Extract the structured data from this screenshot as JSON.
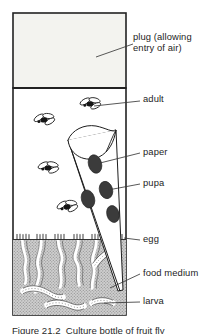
{
  "figure": {
    "caption": "Figure 21.2  Culture bottle of fruit fly",
    "colors": {
      "ink": "#1d1d1d",
      "outline": "#222222",
      "plug_fill": "#f2f2ee",
      "air_fill": "#ffffff",
      "medium_fill": "#c9c9c9",
      "medium_stipple": "#9a9a9a",
      "pupa_fill": "#3a3a3a",
      "fly_body": "#1a1a1a",
      "tunnel_fill": "#ffffff",
      "leader": "#3a3a3a"
    },
    "labels": [
      {
        "id": "plug",
        "name": "plug",
        "text": "plug (allowing\nentry of air)",
        "x": 133,
        "y": 37
      },
      {
        "id": "adult",
        "name": "adult",
        "text": "adult",
        "x": 143,
        "y": 98
      },
      {
        "id": "paper",
        "name": "paper",
        "text": "paper",
        "x": 143,
        "y": 150
      },
      {
        "id": "pupa",
        "name": "pupa",
        "text": "pupa",
        "x": 143,
        "y": 181
      },
      {
        "id": "egg",
        "name": "egg",
        "text": "egg",
        "x": 143,
        "y": 237
      },
      {
        "id": "food-medium",
        "name": "food medium",
        "text": "food medium",
        "x": 143,
        "y": 271
      },
      {
        "id": "larva",
        "name": "larva",
        "text": "larva",
        "x": 143,
        "y": 299
      }
    ],
    "leader_lines": [
      {
        "for": "plug",
        "x1": 96,
        "y1": 57,
        "x2": 131,
        "y2": 44
      },
      {
        "for": "adult",
        "x1": 94,
        "y1": 107,
        "x2": 140,
        "y2": 102
      },
      {
        "for": "paper",
        "x1": 100,
        "y1": 163,
        "x2": 140,
        "y2": 154
      },
      {
        "for": "pupa",
        "x1": 107,
        "y1": 189,
        "x2": 140,
        "y2": 185
      },
      {
        "for": "egg",
        "x1": 122,
        "y1": 238,
        "x2": 140,
        "y2": 240
      },
      {
        "for": "food-medium",
        "x1": 112,
        "y1": 287,
        "x2": 140,
        "y2": 274
      },
      {
        "for": "larva",
        "x1": 105,
        "y1": 303,
        "x2": 140,
        "y2": 302
      }
    ],
    "bottle": {
      "left": 13,
      "right": 126,
      "top": 13,
      "bottom": 315,
      "plug_bottom": 88,
      "medium_top": 239
    },
    "adults": [
      {
        "cx": 44,
        "cy": 120,
        "rot": -12
      },
      {
        "cx": 90,
        "cy": 104,
        "rot": -8
      },
      {
        "cx": 48,
        "cy": 168,
        "rot": -6
      },
      {
        "cx": 67,
        "cy": 207,
        "rot": -14
      }
    ],
    "pupae": [
      {
        "cx": 95,
        "cy": 163,
        "rx": 7.0,
        "ry": 9.5,
        "rot": -16
      },
      {
        "cx": 105,
        "cy": 189,
        "rx": 7.0,
        "ry": 9.0,
        "rot": -16
      },
      {
        "cx": 88,
        "cy": 198,
        "rx": 7.0,
        "ry": 9.5,
        "rot": -16
      },
      {
        "cx": 113,
        "cy": 213,
        "rx": 6.5,
        "ry": 9.0,
        "rot": -16
      }
    ],
    "counts": {
      "adults": 4,
      "pupae": 4,
      "larvae": 4,
      "tunnels": 5,
      "egg_clusters": 5
    }
  }
}
